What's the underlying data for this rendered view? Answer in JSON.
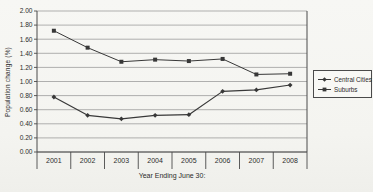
{
  "chart_data": {
    "type": "line",
    "title": "",
    "xlabel": "Year Ending June 30:",
    "ylabel": "Population change (%)",
    "categories": [
      "2001",
      "2002",
      "2003",
      "2004",
      "2005",
      "2006",
      "2007",
      "2008"
    ],
    "series": [
      {
        "name": "Central Cities",
        "marker": "diamond",
        "color": "#383838",
        "values": [
          0.78,
          0.52,
          0.47,
          0.52,
          0.53,
          0.86,
          0.88,
          0.95
        ]
      },
      {
        "name": "Suburbs",
        "marker": "square",
        "color": "#383838",
        "values": [
          1.72,
          1.48,
          1.28,
          1.31,
          1.29,
          1.32,
          1.1,
          1.11
        ]
      }
    ],
    "ylim": [
      0,
      2
    ],
    "y_tick_labels": [
      "2.00",
      "1.80",
      "1.60",
      "1.40",
      "1.20",
      "1.00",
      "0.80",
      "0.60",
      "0.40",
      "0.20",
      "0.00"
    ],
    "grid": "horizontal",
    "legend_position": "right"
  },
  "colors": {
    "background": "#f5f5f2",
    "grid": "#909090",
    "axis": "#4a4a4a",
    "text": "#2b2b2b",
    "series": "#383838",
    "legend_border": "#4a4a4a"
  }
}
